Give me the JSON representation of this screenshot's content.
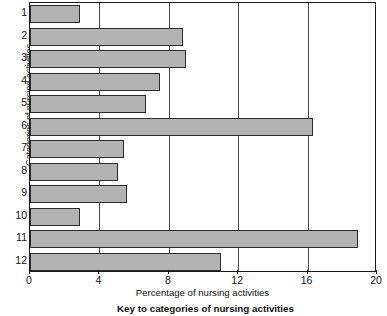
{
  "chart_data": {
    "type": "bar",
    "orientation": "horizontal",
    "title": "",
    "xlabel": "Percentage of nursing activities",
    "ylabel": "Categories of nursing activities",
    "categories": [
      "1",
      "2",
      "3",
      "4",
      "5",
      "6",
      "7",
      "8",
      "9",
      "10",
      "11",
      "12"
    ],
    "values": [
      2.9,
      8.8,
      9.0,
      7.5,
      6.7,
      16.3,
      5.4,
      5.1,
      5.6,
      2.9,
      18.9,
      11.0
    ],
    "xlim": [
      0,
      20
    ],
    "xticks": [
      0,
      4,
      8,
      12,
      16,
      20
    ],
    "xticklabels": [
      "0",
      "4",
      "8",
      "12",
      "16",
      "20"
    ],
    "grid": "vertical",
    "legend": "none",
    "bar_fill_color": "#b3b3b3",
    "bar_edge_color": "#2b2b2b",
    "axis_color": "#1a1a1a"
  },
  "caption": {
    "text": "Key to categories of nursing activities"
  }
}
